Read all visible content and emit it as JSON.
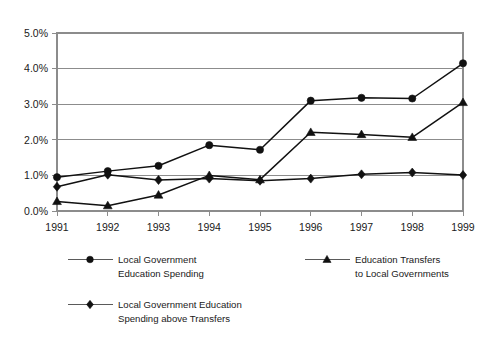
{
  "chart_data": {
    "type": "line",
    "title": "",
    "subtitle": "",
    "xlabel": "",
    "ylabel": "",
    "categories": [
      "1991",
      "1992",
      "1993",
      "1994",
      "1995",
      "1996",
      "1997",
      "1998",
      "1999"
    ],
    "x": [
      1991,
      1992,
      1993,
      1994,
      1995,
      1996,
      1997,
      1998,
      1999
    ],
    "ylim": [
      0.0,
      5.0
    ],
    "xlim": [
      1991,
      1999
    ],
    "ytick_labels": [
      "0.0%",
      "1.0%",
      "2.0%",
      "3.0%",
      "4.0%",
      "5.0%"
    ],
    "ytick_values": [
      0.0,
      1.0,
      2.0,
      3.0,
      4.0,
      5.0
    ],
    "grid": "horizontal",
    "legend_position": "below",
    "units": "percent",
    "series": [
      {
        "name": "Local Government Education Spending",
        "marker": "circle",
        "values": [
          0.95,
          1.12,
          1.27,
          1.85,
          1.72,
          3.1,
          3.18,
          3.16,
          4.15
        ]
      },
      {
        "name": "Education Transfers to Local Governments",
        "marker": "triangle",
        "values": [
          0.27,
          0.15,
          0.45,
          1.0,
          0.88,
          2.21,
          2.15,
          2.07,
          3.05
        ]
      },
      {
        "name": "Local Government Education Spending above Transfers",
        "marker": "diamond",
        "values": [
          0.68,
          1.02,
          0.87,
          0.91,
          0.85,
          0.91,
          1.03,
          1.08,
          1.01
        ]
      }
    ]
  },
  "legend": {
    "entries": [
      {
        "marker": "circle",
        "line1": "Local Government",
        "line2": "Education Spending"
      },
      {
        "marker": "triangle",
        "line1": "Education Transfers",
        "line2": "to Local Governments"
      },
      {
        "marker": "diamond",
        "line1": "Local Government Education",
        "line2": "Spending above Transfers"
      }
    ]
  },
  "colors": {
    "series": "#111111",
    "grid": "#8c8c8c",
    "axis": "#8c8c8c",
    "text": "#1a1a1a",
    "background": "#ffffff"
  }
}
